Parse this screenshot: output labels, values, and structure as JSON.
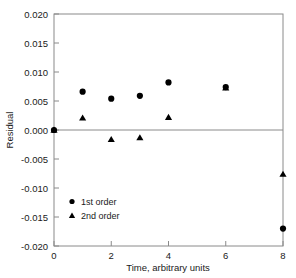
{
  "chart_data": {
    "type": "scatter",
    "title": "",
    "xlabel": "Time, arbitrary units",
    "ylabel": "Residual",
    "xlim": [
      0,
      8
    ],
    "ylim": [
      -0.02,
      0.02
    ],
    "xticks": [
      0,
      2,
      4,
      6,
      8
    ],
    "xtick_labels": [
      "0",
      "2",
      "4",
      "6",
      "8"
    ],
    "yticks": [
      0.02,
      0.015,
      0.01,
      0.005,
      0.0,
      -0.005,
      -0.01,
      -0.015,
      -0.02
    ],
    "ytick_labels": [
      "0.020",
      "0.015",
      "0.010",
      "0.005",
      "0.000",
      "-0.005",
      "-0.010",
      "-0.015",
      "-0.020"
    ],
    "grid": false,
    "zero_line": 0.0,
    "legend_position": "lower-left-inside",
    "series": [
      {
        "name": "1st order",
        "marker": "circle",
        "color": "#000000",
        "x": [
          0,
          1,
          2,
          3,
          4,
          6,
          8
        ],
        "values": [
          0.0,
          0.0066,
          0.0054,
          0.0059,
          0.0082,
          0.0074,
          -0.017
        ]
      },
      {
        "name": "2nd order",
        "marker": "triangle",
        "color": "#000000",
        "x": [
          0,
          1,
          2,
          3,
          4,
          6,
          8
        ],
        "values": [
          0.0,
          0.0021,
          -0.0016,
          -0.0013,
          0.0022,
          0.0073,
          -0.0076
        ]
      }
    ]
  },
  "axes": {
    "frame_color": "#8a8a8a",
    "text_color": "#1a1a1a"
  },
  "legend": {
    "entries": [
      {
        "label": "1st order",
        "marker": "circle-marker"
      },
      {
        "label": "2nd order",
        "marker": "triangle-marker"
      }
    ]
  }
}
